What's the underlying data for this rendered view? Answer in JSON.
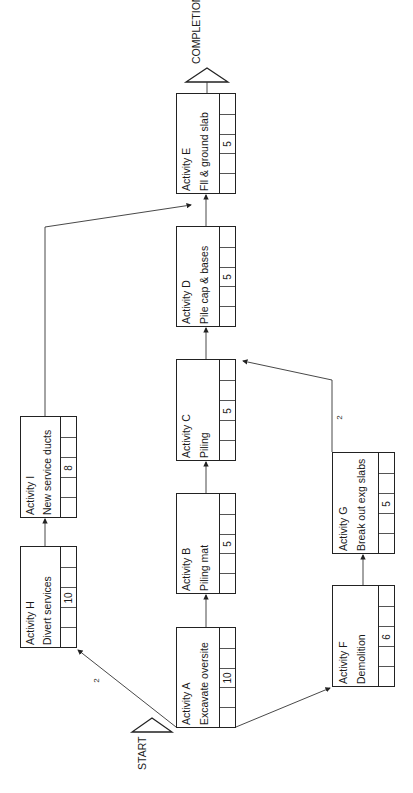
{
  "diagram": {
    "type": "activity-on-node network (rotated 90°)",
    "start_label": "START",
    "end_label": "COMPLETION",
    "nodes": [
      {
        "id": "A",
        "title": "Activity A",
        "desc": "Excavate oversite",
        "duration": "10"
      },
      {
        "id": "B",
        "title": "Activity B",
        "desc": "Piling mat",
        "duration": "5"
      },
      {
        "id": "C",
        "title": "Activity C",
        "desc": "Piling",
        "duration": "5"
      },
      {
        "id": "D",
        "title": "Activity D",
        "desc": "Pile cap & bases",
        "duration": "5"
      },
      {
        "id": "E",
        "title": "Activity E",
        "desc": "Fll & ground slab",
        "duration": "5"
      },
      {
        "id": "F",
        "title": "Activity F",
        "desc": "Demolition",
        "duration": "6"
      },
      {
        "id": "G",
        "title": "Activity G",
        "desc": "Break out exg slabs",
        "duration": "5"
      },
      {
        "id": "H",
        "title": "Activity H",
        "desc": "Divert services",
        "duration": "10"
      },
      {
        "id": "I",
        "title": "Activity I",
        "desc": "New service ducts",
        "duration": "8"
      }
    ],
    "edges": [
      {
        "from": "START",
        "to": "A"
      },
      {
        "from": "START",
        "to": "H",
        "lag": "2"
      },
      {
        "from": "START",
        "to": "F"
      },
      {
        "from": "A",
        "to": "B"
      },
      {
        "from": "B",
        "to": "C"
      },
      {
        "from": "C",
        "to": "D"
      },
      {
        "from": "D",
        "to": "E"
      },
      {
        "from": "H",
        "to": "I"
      },
      {
        "from": "I",
        "to": "E"
      },
      {
        "from": "F",
        "to": "G"
      },
      {
        "from": "G",
        "to": "C",
        "lag": "2"
      },
      {
        "from": "E",
        "to": "COMPLETION"
      }
    ],
    "lags": {
      "start_h": "2",
      "g_c": "2"
    }
  }
}
